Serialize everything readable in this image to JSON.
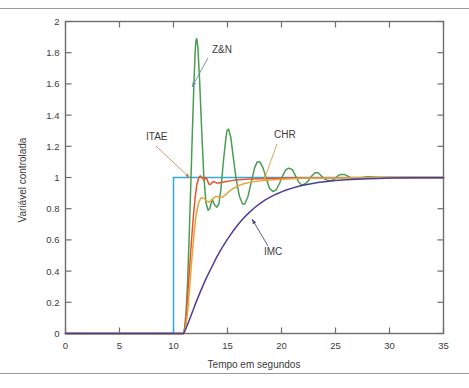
{
  "chart_data": {
    "type": "line",
    "title": "",
    "xlabel": "Tempo em segundos",
    "ylabel": "Variável controlada",
    "xlim": [
      0,
      35
    ],
    "ylim": [
      0,
      2
    ],
    "xticks": [
      0,
      5,
      10,
      15,
      20,
      25,
      30,
      35
    ],
    "xtick_labels": [
      "0",
      "5",
      "10",
      "15",
      "20",
      "25",
      "30",
      "35"
    ],
    "yticks": [
      0,
      0.2,
      0.4,
      0.6,
      0.8,
      1,
      1.2,
      1.4,
      1.6,
      1.8,
      2
    ],
    "ytick_labels": [
      "0",
      "0.2",
      "0.4",
      "0.6",
      "0.8",
      "1",
      "1.2",
      "1.4",
      "1.6",
      "1.8",
      "2"
    ],
    "grid": false,
    "legend": "annotations",
    "step_time": 10,
    "response_start_time": 11,
    "series": [
      {
        "name": "Setpoint",
        "color": "#35a8e0",
        "points": [
          [
            0,
            0
          ],
          [
            10,
            0
          ],
          [
            10,
            1
          ],
          [
            35,
            1
          ]
        ]
      },
      {
        "name": "Z&N",
        "color": "#4a9e52",
        "points": [
          [
            0,
            0
          ],
          [
            10.9,
            0
          ],
          [
            11.0,
            0.02
          ],
          [
            11.15,
            0.12
          ],
          [
            11.3,
            0.32
          ],
          [
            11.45,
            0.62
          ],
          [
            11.6,
            0.95
          ],
          [
            11.75,
            1.3
          ],
          [
            11.9,
            1.62
          ],
          [
            12.0,
            1.8
          ],
          [
            12.08,
            1.88
          ],
          [
            12.15,
            1.89
          ],
          [
            12.25,
            1.84
          ],
          [
            12.4,
            1.65
          ],
          [
            12.6,
            1.32
          ],
          [
            12.8,
            1.02
          ],
          [
            13.0,
            0.84
          ],
          [
            13.2,
            0.79
          ],
          [
            13.35,
            0.8
          ],
          [
            13.5,
            0.84
          ],
          [
            13.6,
            0.86
          ],
          [
            13.7,
            0.84
          ],
          [
            13.85,
            0.82
          ],
          [
            14.0,
            0.81
          ],
          [
            14.2,
            0.83
          ],
          [
            14.4,
            0.93
          ],
          [
            14.6,
            1.09
          ],
          [
            14.8,
            1.22
          ],
          [
            14.95,
            1.3
          ],
          [
            15.1,
            1.31
          ],
          [
            15.3,
            1.26
          ],
          [
            15.5,
            1.15
          ],
          [
            15.8,
            0.99
          ],
          [
            16.1,
            0.88
          ],
          [
            16.4,
            0.83
          ],
          [
            16.6,
            0.83
          ],
          [
            16.9,
            0.88
          ],
          [
            17.2,
            0.97
          ],
          [
            17.5,
            1.06
          ],
          [
            17.75,
            1.1
          ],
          [
            18.0,
            1.1
          ],
          [
            18.3,
            1.06
          ],
          [
            18.6,
            0.99
          ],
          [
            18.9,
            0.93
          ],
          [
            19.2,
            0.91
          ],
          [
            19.5,
            0.92
          ],
          [
            19.8,
            0.96
          ],
          [
            20.1,
            1.01
          ],
          [
            20.4,
            1.05
          ],
          [
            20.7,
            1.06
          ],
          [
            21.0,
            1.05
          ],
          [
            21.3,
            1.01
          ],
          [
            21.6,
            0.97
          ],
          [
            21.9,
            0.95
          ],
          [
            22.2,
            0.96
          ],
          [
            22.5,
            0.98
          ],
          [
            22.8,
            1.01
          ],
          [
            23.1,
            1.03
          ],
          [
            23.4,
            1.03
          ],
          [
            23.7,
            1.01
          ],
          [
            24.0,
            0.99
          ],
          [
            24.3,
            0.98
          ],
          [
            24.6,
            0.98
          ],
          [
            24.9,
            0.99
          ],
          [
            25.2,
            1.01
          ],
          [
            25.5,
            1.02
          ],
          [
            25.8,
            1.02
          ],
          [
            26.1,
            1.01
          ],
          [
            26.5,
            0.995
          ],
          [
            27.0,
            0.99
          ],
          [
            27.5,
            1.0
          ],
          [
            28.0,
            1.005
          ],
          [
            29.0,
            1.0
          ],
          [
            31.0,
            1.0
          ],
          [
            35,
            1.0
          ]
        ]
      },
      {
        "name": "ITAE",
        "color": "#e8542a",
        "points": [
          [
            0,
            0
          ],
          [
            10.95,
            0
          ],
          [
            11.1,
            0.05
          ],
          [
            11.25,
            0.18
          ],
          [
            11.45,
            0.38
          ],
          [
            11.65,
            0.58
          ],
          [
            11.85,
            0.76
          ],
          [
            12.0,
            0.87
          ],
          [
            12.15,
            0.95
          ],
          [
            12.3,
            0.99
          ],
          [
            12.4,
            1.005
          ],
          [
            12.5,
            1.01
          ],
          [
            12.65,
            1.0
          ],
          [
            12.8,
            0.985
          ],
          [
            12.9,
            0.99
          ],
          [
            13.0,
            1.0
          ],
          [
            13.1,
            0.99
          ],
          [
            13.2,
            0.97
          ],
          [
            13.3,
            0.955
          ],
          [
            13.4,
            0.955
          ],
          [
            13.55,
            0.965
          ],
          [
            13.7,
            0.975
          ],
          [
            13.85,
            0.97
          ],
          [
            14.0,
            0.965
          ],
          [
            14.2,
            0.965
          ],
          [
            14.5,
            0.97
          ],
          [
            14.9,
            0.975
          ],
          [
            15.4,
            0.98
          ],
          [
            16.0,
            0.985
          ],
          [
            17.0,
            0.99
          ],
          [
            18.0,
            0.992
          ],
          [
            19.5,
            0.995
          ],
          [
            21.0,
            0.997
          ],
          [
            23.0,
            0.998
          ],
          [
            26.0,
            0.999
          ],
          [
            30,
            1.0
          ],
          [
            35,
            1.0
          ]
        ]
      },
      {
        "name": "CHR",
        "color": "#e8a33d",
        "points": [
          [
            0,
            0
          ],
          [
            10.95,
            0
          ],
          [
            11.1,
            0.03
          ],
          [
            11.3,
            0.13
          ],
          [
            11.5,
            0.3
          ],
          [
            11.7,
            0.48
          ],
          [
            11.9,
            0.64
          ],
          [
            12.1,
            0.76
          ],
          [
            12.3,
            0.83
          ],
          [
            12.5,
            0.865
          ],
          [
            12.7,
            0.87
          ],
          [
            12.9,
            0.862
          ],
          [
            13.1,
            0.848
          ],
          [
            13.3,
            0.843
          ],
          [
            13.5,
            0.852
          ],
          [
            13.7,
            0.868
          ],
          [
            13.9,
            0.878
          ],
          [
            14.1,
            0.878
          ],
          [
            14.3,
            0.872
          ],
          [
            14.5,
            0.873
          ],
          [
            14.8,
            0.888
          ],
          [
            15.1,
            0.908
          ],
          [
            15.5,
            0.928
          ],
          [
            16.0,
            0.948
          ],
          [
            16.6,
            0.962
          ],
          [
            17.3,
            0.972
          ],
          [
            18.2,
            0.98
          ],
          [
            19.2,
            0.986
          ],
          [
            20.5,
            0.991
          ],
          [
            22.0,
            0.995
          ],
          [
            24.0,
            0.997
          ],
          [
            27.0,
            0.999
          ],
          [
            31,
            1.0
          ],
          [
            35,
            1.0
          ]
        ]
      },
      {
        "name": "IMC",
        "color": "#4a3f9c",
        "points": [
          [
            0,
            0
          ],
          [
            10.95,
            0
          ],
          [
            11.2,
            0.04
          ],
          [
            11.6,
            0.11
          ],
          [
            12.0,
            0.185
          ],
          [
            12.5,
            0.27
          ],
          [
            13.0,
            0.35
          ],
          [
            13.5,
            0.42
          ],
          [
            14.0,
            0.49
          ],
          [
            14.5,
            0.55
          ],
          [
            15.0,
            0.605
          ],
          [
            15.5,
            0.655
          ],
          [
            16.0,
            0.7
          ],
          [
            16.5,
            0.74
          ],
          [
            17.0,
            0.775
          ],
          [
            17.5,
            0.806
          ],
          [
            18.0,
            0.833
          ],
          [
            18.5,
            0.856
          ],
          [
            19.0,
            0.876
          ],
          [
            19.5,
            0.893
          ],
          [
            20.0,
            0.908
          ],
          [
            20.5,
            0.921
          ],
          [
            21.0,
            0.932
          ],
          [
            21.5,
            0.942
          ],
          [
            22.0,
            0.95
          ],
          [
            22.5,
            0.957
          ],
          [
            23.0,
            0.963
          ],
          [
            23.5,
            0.969
          ],
          [
            24.0,
            0.973
          ],
          [
            25.0,
            0.98
          ],
          [
            26.0,
            0.985
          ],
          [
            27.0,
            0.989
          ],
          [
            28.0,
            0.992
          ],
          [
            29.0,
            0.994
          ],
          [
            30.0,
            0.996
          ],
          [
            32.0,
            0.998
          ],
          [
            35,
            0.999
          ]
        ]
      }
    ],
    "annotations": [
      {
        "text": "Z&N",
        "label_x": 212,
        "label_y": 53,
        "line_x1": 208,
        "line_y1": 58,
        "line_x2": 192,
        "line_y2": 87,
        "color": "#6a8ba0"
      },
      {
        "text": "ITAE",
        "label_x": 146,
        "label_y": 140,
        "line_x1": 156,
        "line_y1": 146,
        "line_x2": 190,
        "line_y2": 178,
        "color": "#c08a72"
      },
      {
        "text": "CHR",
        "label_x": 274,
        "label_y": 138,
        "line_x1": 277,
        "line_y1": 144,
        "line_x2": 264,
        "line_y2": 180,
        "color": "#d89c49"
      },
      {
        "text": "IMC",
        "label_x": 264,
        "label_y": 255,
        "line_x1": 268,
        "line_y1": 246,
        "line_x2": 252,
        "line_y2": 219,
        "color": "#4a4a8c"
      }
    ]
  }
}
